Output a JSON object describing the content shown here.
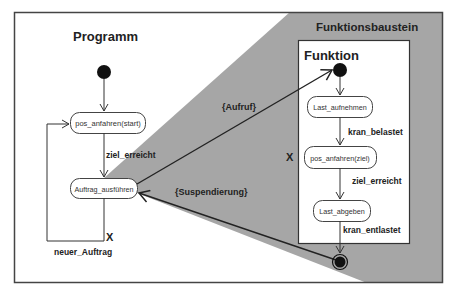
{
  "colors": {
    "background": "#ffffff",
    "frame": "#444444",
    "wedge": "#a6a6a6",
    "line": "#222222",
    "node": "#111111"
  },
  "program": {
    "title": "Programm",
    "states": {
      "pos_start": "pos_anfahren(start)",
      "auftrag": "Auftrag_ausführen"
    },
    "transitions": {
      "ziel_erreicht": "ziel_erreicht",
      "neuer_auftrag": "neuer_Auftrag",
      "x_mark": "X"
    }
  },
  "function_block": {
    "title": "Funktionsbaustein",
    "inner_title": "Funktion",
    "states": {
      "last_aufnehmen": "Last_aufnehmen",
      "pos_ziel": "pos_anfahren(ziel)",
      "last_abgeben": "Last_abgeben"
    },
    "transitions": {
      "kran_belastet": "kran_belastet",
      "ziel_erreicht": "ziel_erreicht",
      "kran_entlastet": "kran_entlastet",
      "x_mark": "X"
    }
  },
  "links": {
    "call": "{Aufruf}",
    "suspend": "{Suspendierung}"
  }
}
